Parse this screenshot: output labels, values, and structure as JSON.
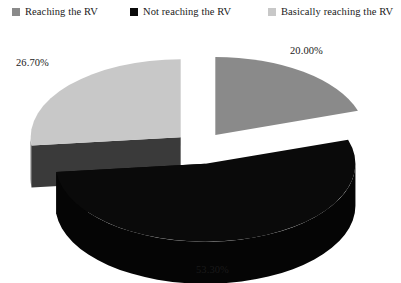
{
  "chart_data": {
    "type": "pie",
    "title": "",
    "three_d": true,
    "exploded": true,
    "legend_position": "top",
    "grid": false,
    "xlabel": "",
    "ylabel": "",
    "categories": [
      "Reaching the RV",
      "Not reaching the RV",
      "Basically reaching the RV"
    ],
    "values": [
      20.0,
      53.3,
      26.7
    ],
    "labels": [
      "20.00%",
      "53.30%",
      "26.70%"
    ],
    "colors": [
      "#8a8a8a",
      "#0a0a0a",
      "#c8c8c8"
    ],
    "side_colors": [
      "#1f1f1f",
      "#050505",
      "#3a3a3a"
    ],
    "legend": [
      {
        "label": "Reaching the RV",
        "color": "#8a8a8a",
        "value": 20.0,
        "value_label": "20.00%"
      },
      {
        "label": "Not reaching the RV",
        "color": "#0a0a0a",
        "value": 53.3,
        "value_label": "53.30%"
      },
      {
        "label": "Basically reaching the RV",
        "color": "#c8c8c8",
        "value": 26.7,
        "value_label": "26.70%"
      }
    ]
  },
  "legend": {
    "items": [
      {
        "label": "Reaching the RV"
      },
      {
        "label": "Not reaching the RV"
      },
      {
        "label": "Basically reaching the RV"
      }
    ]
  },
  "labels": {
    "slice_0": "20.00%",
    "slice_1": "53.30%",
    "slice_2": "26.70%"
  },
  "colors": {
    "slice_gray": "#8a8a8a",
    "slice_black": "#0a0a0a",
    "slice_light": "#c8c8c8",
    "background": "#ffffff",
    "text": "#1a1a1a"
  }
}
